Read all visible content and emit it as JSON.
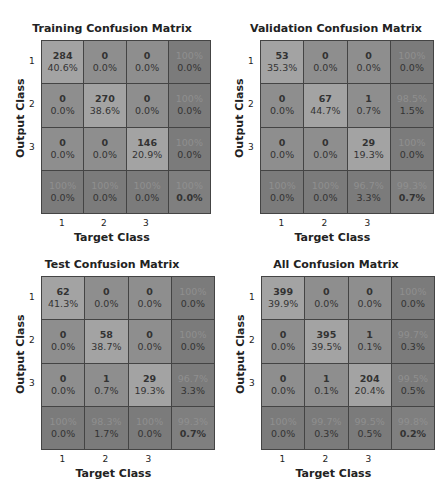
{
  "chart_data": [
    {
      "type": "heatmap",
      "title": "Training Confusion Matrix",
      "xlabel": "Target Class",
      "ylabel": "Output Class",
      "x_ticks": [
        "1",
        "2",
        "3"
      ],
      "y_ticks": [
        "1",
        "2",
        "3"
      ],
      "counts": [
        [
          284,
          0,
          0
        ],
        [
          0,
          270,
          0
        ],
        [
          0,
          0,
          146
        ]
      ],
      "cell_pct": [
        [
          "40.6%",
          "0.0%",
          "0.0%"
        ],
        [
          "0.0%",
          "38.6%",
          "0.0%"
        ],
        [
          "0.0%",
          "0.0%",
          "20.9%"
        ]
      ],
      "row_summary": [
        [
          "100%",
          "0.0%"
        ],
        [
          "100%",
          "0.0%"
        ],
        [
          "100%",
          "0.0%"
        ]
      ],
      "col_summary": [
        [
          "100%",
          "0.0%"
        ],
        [
          "100%",
          "0.0%"
        ],
        [
          "100%",
          "0.0%"
        ]
      ],
      "overall": [
        "100%",
        "0.0%"
      ]
    },
    {
      "type": "heatmap",
      "title": "Validation Confusion Matrix",
      "xlabel": "Target Class",
      "ylabel": "Output Class",
      "x_ticks": [
        "1",
        "2",
        "3"
      ],
      "y_ticks": [
        "1",
        "2",
        "3"
      ],
      "counts": [
        [
          53,
          0,
          0
        ],
        [
          0,
          67,
          1
        ],
        [
          0,
          0,
          29
        ]
      ],
      "cell_pct": [
        [
          "35.3%",
          "0.0%",
          "0.0%"
        ],
        [
          "0.0%",
          "44.7%",
          "0.7%"
        ],
        [
          "0.0%",
          "0.0%",
          "19.3%"
        ]
      ],
      "row_summary": [
        [
          "100%",
          "0.0%"
        ],
        [
          "98.5%",
          "1.5%"
        ],
        [
          "100%",
          "0.0%"
        ]
      ],
      "col_summary": [
        [
          "100%",
          "0.0%"
        ],
        [
          "100%",
          "0.0%"
        ],
        [
          "96.7%",
          "3.3%"
        ]
      ],
      "overall": [
        "99.3%",
        "0.7%"
      ]
    },
    {
      "type": "heatmap",
      "title": "Test Confusion Matrix",
      "xlabel": "Target Class",
      "ylabel": "Output Class",
      "x_ticks": [
        "1",
        "2",
        "3"
      ],
      "y_ticks": [
        "1",
        "2",
        "3"
      ],
      "counts": [
        [
          62,
          0,
          0
        ],
        [
          0,
          58,
          0
        ],
        [
          0,
          1,
          29
        ]
      ],
      "cell_pct": [
        [
          "41.3%",
          "0.0%",
          "0.0%"
        ],
        [
          "0.0%",
          "38.7%",
          "0.0%"
        ],
        [
          "0.0%",
          "0.7%",
          "19.3%"
        ]
      ],
      "row_summary": [
        [
          "100%",
          "0.0%"
        ],
        [
          "100%",
          "0.0%"
        ],
        [
          "96.7%",
          "3.3%"
        ]
      ],
      "col_summary": [
        [
          "100%",
          "0.0%"
        ],
        [
          "98.3%",
          "1.7%"
        ],
        [
          "100%",
          "0.0%"
        ]
      ],
      "overall": [
        "99.3%",
        "0.7%"
      ]
    },
    {
      "type": "heatmap",
      "title": "All Confusion Matrix",
      "xlabel": "Target Class",
      "ylabel": "Output Class",
      "x_ticks": [
        "1",
        "2",
        "3"
      ],
      "y_ticks": [
        "1",
        "2",
        "3"
      ],
      "counts": [
        [
          399,
          0,
          0
        ],
        [
          0,
          395,
          1
        ],
        [
          0,
          1,
          204
        ]
      ],
      "cell_pct": [
        [
          "39.9%",
          "0.0%",
          "0.0%"
        ],
        [
          "0.0%",
          "39.5%",
          "0.1%"
        ],
        [
          "0.0%",
          "0.1%",
          "20.4%"
        ]
      ],
      "row_summary": [
        [
          "100%",
          "0.0%"
        ],
        [
          "99.7%",
          "0.3%"
        ],
        [
          "99.5%",
          "0.5%"
        ]
      ],
      "col_summary": [
        [
          "100%",
          "0.0%"
        ],
        [
          "99.7%",
          "0.3%"
        ],
        [
          "99.5%",
          "0.5%"
        ]
      ],
      "overall": [
        "99.8%",
        "0.2%"
      ]
    }
  ]
}
